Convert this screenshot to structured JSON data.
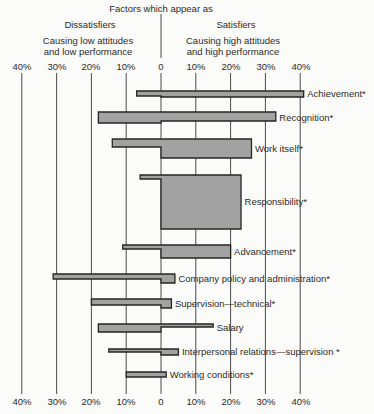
{
  "chart_data": {
    "type": "bar",
    "orientation": "horizontal-diverging",
    "title": "Factors which appear as",
    "left_group": {
      "title": "Dissatisfiers",
      "subtitle": [
        "Causing low attitudes",
        "and low performance"
      ]
    },
    "right_group": {
      "title": "Satisfiers",
      "subtitle": [
        "Causing high attitudes",
        "and high performance"
      ]
    },
    "x_unit": "percent frequency",
    "xlim": [
      -40,
      40
    ],
    "x_ticks": [
      "40%",
      "30%",
      "20%",
      "10%",
      "0",
      "10%",
      "20%",
      "30%",
      "40%"
    ],
    "grid": "vertical lines at every 10%",
    "categories": [
      "Achievement*",
      "Recognition*",
      "Work itself*",
      "Responsibility*",
      "Advancement*",
      "Company policy and administration*",
      "Supervision—technical*",
      "Salary",
      "Interpersonal relations—supervision *",
      "Working conditions*"
    ],
    "series": [
      {
        "name": "Dissatisfiers",
        "side": "left",
        "values": [
          7,
          18,
          14,
          6,
          11,
          31,
          20,
          18,
          15,
          10
        ]
      },
      {
        "name": "Satisfiers",
        "side": "right",
        "values": [
          41,
          33,
          26,
          23,
          20,
          4,
          3,
          15,
          5,
          1.5
        ]
      }
    ],
    "relative_duration": {
      "note": "bar thickness (relative units)",
      "dissatisfiers": [
        1.0,
        2.2,
        1.6,
        0.8,
        0.8,
        1.0,
        1.2,
        1.6,
        0.6,
        1.0
      ],
      "satisfiers": [
        1.2,
        1.8,
        3.8,
        10.8,
        2.6,
        1.8,
        1.8,
        0.6,
        1.2,
        1.0
      ]
    },
    "colors": {
      "bar_fill": "#a2a2a2",
      "bar_outline": "#262626",
      "gridline": "#4a4a4a"
    }
  }
}
